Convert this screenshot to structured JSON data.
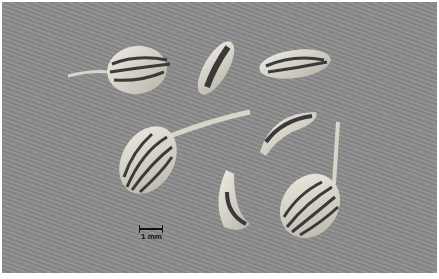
{
  "image": {
    "subject": "seeds (schizocarps) of an apiaceous plant on gray background",
    "seed_count": 7,
    "background_color": "#8c8c8c",
    "seed_color": "#d9d6cc",
    "rib_color": "#3a3a3a"
  },
  "scale_bar": {
    "label": "1 mm"
  }
}
